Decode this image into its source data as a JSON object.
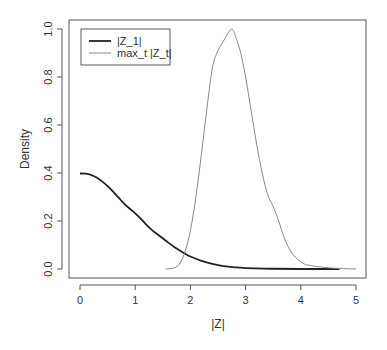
{
  "chart_data": {
    "type": "line",
    "title": "",
    "xlabel": "|Z|",
    "ylabel": "Density",
    "xlim": [
      -0.1,
      5.2
    ],
    "ylim": [
      -0.03,
      1.03
    ],
    "x_ticks": [
      "0",
      "1",
      "2",
      "3",
      "4",
      "5"
    ],
    "y_ticks": [
      "0.0",
      "0.2",
      "0.4",
      "0.6",
      "0.8",
      "1.0"
    ],
    "grid": false,
    "legend_position": "top-left",
    "series": [
      {
        "name": "|Z_1|",
        "color": "#222222",
        "width": 1.8,
        "x": [
          0.0,
          0.1,
          0.2,
          0.3,
          0.4,
          0.5,
          0.6,
          0.7,
          0.8,
          0.9,
          1.0,
          1.1,
          1.2,
          1.3,
          1.4,
          1.5,
          1.6,
          1.7,
          1.8,
          1.9,
          2.0,
          2.2,
          2.4,
          2.6,
          2.8,
          3.0,
          3.5,
          4.0,
          4.5,
          4.7
        ],
        "y": [
          0.398,
          0.397,
          0.392,
          0.381,
          0.365,
          0.345,
          0.322,
          0.297,
          0.272,
          0.252,
          0.232,
          0.21,
          0.185,
          0.163,
          0.145,
          0.128,
          0.11,
          0.093,
          0.078,
          0.064,
          0.052,
          0.034,
          0.021,
          0.012,
          0.007,
          0.004,
          0.001,
          0.0,
          0.0,
          0.0
        ]
      },
      {
        "name": "max_t |Z_t|",
        "color": "#888888",
        "width": 1.0,
        "x": [
          1.55,
          1.7,
          1.8,
          1.9,
          2.0,
          2.1,
          2.2,
          2.3,
          2.4,
          2.5,
          2.6,
          2.7,
          2.75,
          2.8,
          2.9,
          3.0,
          3.1,
          3.2,
          3.3,
          3.4,
          3.5,
          3.6,
          3.7,
          3.8,
          3.9,
          4.0,
          4.1,
          4.3,
          4.5,
          4.7,
          5.0
        ],
        "y": [
          0.0,
          0.004,
          0.02,
          0.07,
          0.16,
          0.3,
          0.48,
          0.67,
          0.84,
          0.91,
          0.95,
          0.99,
          1.0,
          0.98,
          0.91,
          0.8,
          0.66,
          0.52,
          0.4,
          0.31,
          0.26,
          0.2,
          0.13,
          0.08,
          0.05,
          0.03,
          0.018,
          0.01,
          0.005,
          0.002,
          0.0
        ]
      }
    ]
  }
}
